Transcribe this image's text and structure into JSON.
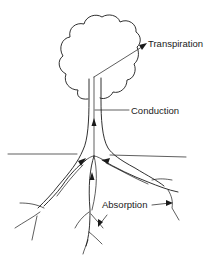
{
  "diagram": {
    "labels": {
      "transpiration": "Transpiration",
      "conduction": "Conduction",
      "absorption": "Absorption"
    },
    "colors": {
      "line": "#1a1a1a",
      "background": "#ffffff"
    }
  }
}
